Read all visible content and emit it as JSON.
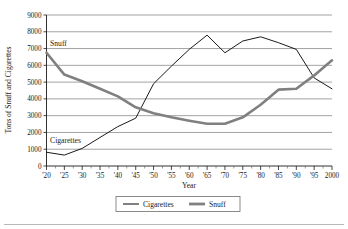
{
  "chart_data": {
    "type": "line",
    "title": "",
    "xlabel": "Year",
    "ylabel": "Tons of Snuff and Cigarettes",
    "ylim": [
      0,
      9000
    ],
    "ytick_step": 1000,
    "grid": true,
    "legend_position": "bottom-center",
    "categories": [
      "'20",
      "'25",
      "'30",
      "'35",
      "'40",
      "'45",
      "'50",
      "'55",
      "'60",
      "'65",
      "'70",
      "'75",
      "'80",
      "'85",
      "'90",
      "'95",
      "2000"
    ],
    "x_values": [
      1920,
      1925,
      1930,
      1935,
      1940,
      1945,
      1950,
      1955,
      1960,
      1965,
      1970,
      1975,
      1980,
      1985,
      1990,
      1995,
      2000
    ],
    "ytick_labels": [
      "0",
      "1000",
      "2000",
      "3000",
      "4000",
      "5000",
      "6000",
      "7000",
      "8000",
      "9000"
    ],
    "ytick_values": [
      0,
      1000,
      2000,
      3000,
      4000,
      5000,
      6000,
      7000,
      8000,
      9000
    ],
    "series": [
      {
        "name": "Cigarettes",
        "color": "#1a1a1a",
        "line_width": 1.0,
        "values": [
          820,
          650,
          1050,
          1700,
          2350,
          2850,
          4900,
          5950,
          6950,
          7800,
          6750,
          7450,
          7700,
          7350,
          6950,
          5250,
          4600
        ]
      },
      {
        "name": "Snuff",
        "color": "#808080",
        "line_width": 2.6,
        "values": [
          6750,
          5450,
          5050,
          4600,
          4150,
          3500,
          3150,
          2900,
          2700,
          2520,
          2520,
          2900,
          3650,
          4550,
          4600,
          5400,
          6300
        ]
      }
    ],
    "annotations": [
      {
        "text": "Snuff",
        "x_value": 1921,
        "y_value": 7150
      },
      {
        "text": "Cigarettes",
        "x_value": 1921,
        "y_value": 1350
      }
    ],
    "legend": [
      {
        "label": "Cigarettes",
        "color": "#1a1a1a",
        "line_width": 1.0
      },
      {
        "label": "Snuff",
        "color": "#808080",
        "line_width": 2.8
      }
    ]
  }
}
